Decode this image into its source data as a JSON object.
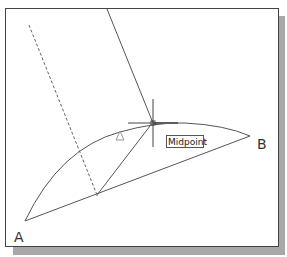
{
  "drawing": {
    "labels": {
      "point_a": "A",
      "point_b": "B"
    },
    "snap_tooltip": "Midpoint",
    "colors": {
      "line": "#555555",
      "crosshair": "#444444",
      "marker": "#999999",
      "shadow": "#a8a8a8",
      "frame": "#444444"
    },
    "geometry": {
      "point_a": [
        25,
        221
      ],
      "point_b": [
        250,
        136
      ],
      "arc_apex": [
        153,
        123
      ],
      "crosshair_center": [
        153,
        124
      ],
      "chord_point": [
        97,
        195
      ],
      "dashed_line": [
        [
          29,
          25
        ],
        [
          97,
          195
        ]
      ],
      "leader_line": [
        [
          107,
          8
        ],
        [
          153,
          124
        ]
      ]
    }
  }
}
